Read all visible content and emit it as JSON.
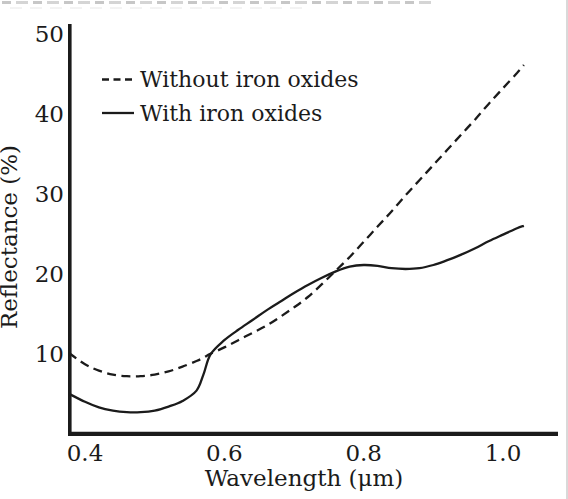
{
  "chart_data": {
    "type": "line",
    "title": "",
    "xlabel": "Wavelength (μm)",
    "ylabel": "Reflectance (%)",
    "xlim": [
      0.376,
      1.08
    ],
    "ylim": [
      0,
      50
    ],
    "x_tick_labels": [
      "0.4",
      "0.6",
      "0.8",
      "1.0"
    ],
    "x_tick_values": [
      0.4,
      0.6,
      0.8,
      1.0
    ],
    "y_tick_labels": [
      "10",
      "20",
      "30",
      "40",
      "50"
    ],
    "y_tick_values": [
      10,
      20,
      30,
      40,
      50
    ],
    "grid": false,
    "legend_position": "upper-left-inside",
    "axis_color": "#1b1b1b",
    "x": [
      0.377,
      0.4,
      0.42,
      0.44,
      0.46,
      0.48,
      0.5,
      0.52,
      0.54,
      0.56,
      0.57,
      0.58,
      0.6,
      0.62,
      0.64,
      0.66,
      0.68,
      0.7,
      0.72,
      0.74,
      0.76,
      0.78,
      0.8,
      0.82,
      0.84,
      0.86,
      0.88,
      0.9,
      0.92,
      0.94,
      0.96,
      0.98,
      1.0,
      1.02,
      1.03
    ],
    "series": [
      {
        "name": "Without iron oxides",
        "line_style": "dashed",
        "color": "#1b1b1b",
        "values": [
          10.0,
          8.6,
          7.8,
          7.3,
          7.1,
          7.1,
          7.3,
          7.7,
          8.3,
          9.0,
          9.4,
          9.9,
          10.7,
          11.6,
          12.5,
          13.4,
          14.5,
          15.7,
          17.0,
          18.6,
          20.3,
          22.0,
          23.9,
          25.8,
          27.7,
          29.7,
          31.6,
          33.5,
          35.4,
          37.3,
          39.2,
          41.2,
          43.1,
          45.0,
          46.0
        ]
      },
      {
        "name": "With iron oxides",
        "line_style": "solid",
        "color": "#1b1b1b",
        "values": [
          4.9,
          3.9,
          3.2,
          2.8,
          2.6,
          2.6,
          2.8,
          3.3,
          4.0,
          5.3,
          7.3,
          9.8,
          11.6,
          12.9,
          14.1,
          15.3,
          16.4,
          17.5,
          18.5,
          19.4,
          20.2,
          20.8,
          21.0,
          20.9,
          20.6,
          20.5,
          20.6,
          21.0,
          21.6,
          22.3,
          23.1,
          24.0,
          24.8,
          25.6,
          25.9
        ]
      }
    ]
  }
}
